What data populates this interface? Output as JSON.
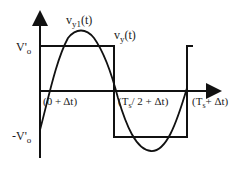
{
  "diagram": {
    "labels": {
      "vy1": {
        "main": "v",
        "sub": "y1",
        "tail": "(t)"
      },
      "vy": {
        "main": "v",
        "sub": "y",
        "tail": "(t)"
      },
      "v_pos": {
        "main": "V'",
        "sub": "o"
      },
      "v_neg": {
        "main": "-V'",
        "sub": "o"
      },
      "t0": "(0 + Δt)",
      "t_half": {
        "pre": "(T",
        "sub": "s",
        "post": "/ 2 + Δt)"
      },
      "t_full": {
        "pre": "(T",
        "sub": "s",
        "post": "+ Δt)"
      }
    },
    "colors": {
      "stroke": "#111111",
      "background": "#ffffff"
    }
  }
}
